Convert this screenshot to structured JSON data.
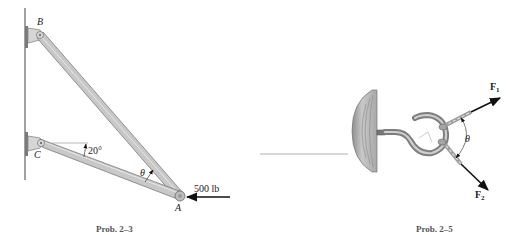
{
  "figures": [
    {
      "id": "prob-2-3",
      "caption": "Prob. 2–3",
      "labels": {
        "point_b": "B",
        "point_c": "C",
        "point_a": "A",
        "angle_theta": "θ",
        "angle_20": "20°",
        "load": "500 lb"
      }
    },
    {
      "id": "prob-2-5",
      "caption": "Prob. 2–5",
      "labels": {
        "force_1": "F",
        "force_1_sub": "1",
        "force_2": "F",
        "force_2_sub": "2",
        "angle_theta": "θ"
      }
    }
  ],
  "colors": {
    "member_fill": "#c9c9c9",
    "member_stroke": "#7a7a7a",
    "wall": "#8a8a8a",
    "wood": "#bdbdbd",
    "hook": "#9a9a9a",
    "arrow": "#111111",
    "caption": "#555555"
  }
}
